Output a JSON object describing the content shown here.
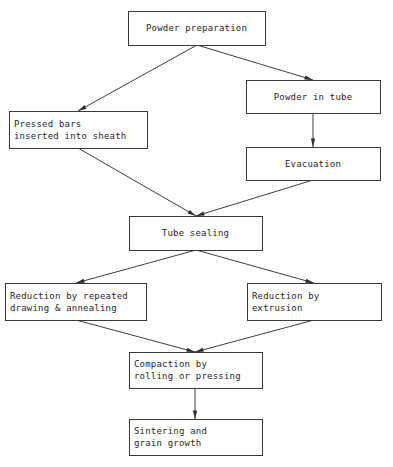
{
  "diagram": {
    "type": "flowchart",
    "orientation": "top-to-bottom",
    "background_color": "#ffffff",
    "line_color": "#3f3f3f",
    "text_color": "#26262a",
    "nodes": [
      {
        "id": "powder-preparation",
        "label": "Powder preparation",
        "lines": [
          "Powder preparation"
        ],
        "align": "center",
        "x": 128,
        "y": 11,
        "w": 137,
        "h": 34
      },
      {
        "id": "powder-in-tube",
        "label": "Powder in tube",
        "lines": [
          "Powder in tube"
        ],
        "align": "center",
        "x": 246,
        "y": 80,
        "w": 134,
        "h": 33
      },
      {
        "id": "pressed-bars-inserted-into-sheath",
        "label": "Pressed bars inserted into sheath",
        "lines": [
          "Pressed bars",
          "inserted into sheath"
        ],
        "align": "left",
        "x": 9,
        "y": 111,
        "w": 138,
        "h": 37
      },
      {
        "id": "evacuation",
        "label": "Evacuation",
        "lines": [
          "Evacuation"
        ],
        "align": "center",
        "x": 246,
        "y": 147,
        "w": 134,
        "h": 33
      },
      {
        "id": "tube-sealing",
        "label": "Tube sealing",
        "lines": [
          "Tube sealing"
        ],
        "align": "center",
        "x": 129,
        "y": 216,
        "w": 133,
        "h": 34
      },
      {
        "id": "reduction-by-repeated-drawing-annealing",
        "label": "Reduction by repeated drawing & annealing",
        "lines": [
          "Reduction by repeated",
          "drawing & annealing"
        ],
        "align": "left",
        "x": 5,
        "y": 283,
        "w": 141,
        "h": 37
      },
      {
        "id": "reduction-by-extrusion",
        "label": "Reduction by extrusion",
        "lines": [
          "Reduction by",
          "extrusion"
        ],
        "align": "left",
        "x": 247,
        "y": 283,
        "w": 134,
        "h": 37
      },
      {
        "id": "compaction-by-rolling-or-pressing",
        "label": "Compaction by rolling or pressing",
        "lines": [
          "Compaction by",
          "rolling or pressing"
        ],
        "align": "left",
        "x": 129,
        "y": 352,
        "w": 133,
        "h": 36
      },
      {
        "id": "sintering-and-grain-growth",
        "label": "Sintering and grain growth",
        "lines": [
          "Sintering and",
          "grain growth"
        ],
        "align": "left",
        "x": 129,
        "y": 419,
        "w": 133,
        "h": 36
      }
    ],
    "edges": [
      {
        "id": "powder-preparation-to-pressed-bars",
        "from": "powder-preparation",
        "to": "pressed-bars-inserted-into-sheath",
        "points": "197,45 78,111"
      },
      {
        "id": "powder-preparation-to-powder-in-tube",
        "from": "powder-preparation",
        "to": "powder-in-tube",
        "points": "197,45 313,80"
      },
      {
        "id": "powder-in-tube-to-evacuation",
        "from": "powder-in-tube",
        "to": "evacuation",
        "points": "313,113 313,147"
      },
      {
        "id": "pressed-bars-to-tube-sealing",
        "from": "pressed-bars-inserted-into-sheath",
        "to": "tube-sealing",
        "points": "78,148 196,216"
      },
      {
        "id": "evacuation-to-tube-sealing",
        "from": "evacuation",
        "to": "tube-sealing",
        "points": "313,180 196,216"
      },
      {
        "id": "tube-sealing-to-reduction-drawing",
        "from": "tube-sealing",
        "to": "reduction-by-repeated-drawing-annealing",
        "points": "196,250 76,283"
      },
      {
        "id": "tube-sealing-to-reduction-extrusion",
        "from": "tube-sealing",
        "to": "reduction-by-extrusion",
        "points": "196,250 314,283"
      },
      {
        "id": "reduction-drawing-to-compaction",
        "from": "reduction-by-repeated-drawing-annealing",
        "to": "compaction-by-rolling-or-pressing",
        "points": "76,320 195,352"
      },
      {
        "id": "reduction-extrusion-to-compaction",
        "from": "reduction-by-extrusion",
        "to": "compaction-by-rolling-or-pressing",
        "points": "314,320 195,352"
      },
      {
        "id": "compaction-to-sintering",
        "from": "compaction-by-rolling-or-pressing",
        "to": "sintering-and-grain-growth",
        "points": "195,388 195,419"
      }
    ]
  }
}
